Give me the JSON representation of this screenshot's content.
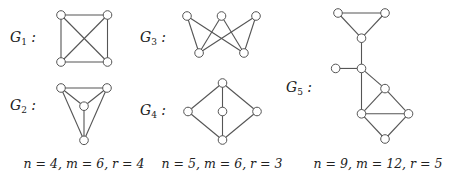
{
  "graphs": [
    {
      "id": "G1",
      "label": "G",
      "subscript": "1",
      "suffix": " :",
      "vertices": [
        [
          0,
          0
        ],
        [
          1,
          0
        ],
        [
          0,
          1
        ],
        [
          1,
          1
        ]
      ],
      "edges": [
        [
          0,
          1
        ],
        [
          0,
          2
        ],
        [
          1,
          3
        ],
        [
          2,
          3
        ],
        [
          0,
          3
        ],
        [
          1,
          2
        ]
      ]
    },
    {
      "id": "G2",
      "label": "G",
      "subscript": "2",
      "suffix": " :",
      "vertices": [
        [
          0,
          0
        ],
        [
          2,
          0
        ],
        [
          1,
          0.4
        ],
        [
          1,
          1.15
        ]
      ],
      "edges": [
        [
          0,
          1
        ],
        [
          0,
          2
        ],
        [
          1,
          2
        ],
        [
          2,
          3
        ],
        [
          0,
          3
        ],
        [
          1,
          3
        ]
      ]
    },
    {
      "id": "G3",
      "label": "G",
      "subscript": "3",
      "suffix": " :",
      "vertices": [
        [
          0,
          0
        ],
        [
          1,
          0
        ],
        [
          2,
          0
        ],
        [
          0.35,
          1
        ],
        [
          1.65,
          1
        ]
      ],
      "edges": [
        [
          0,
          3
        ],
        [
          0,
          4
        ],
        [
          1,
          3
        ],
        [
          1,
          4
        ],
        [
          2,
          3
        ],
        [
          2,
          4
        ]
      ]
    },
    {
      "id": "G4",
      "label": "G",
      "subscript": "4",
      "suffix": " :",
      "vertices": [
        [
          1,
          0
        ],
        [
          0,
          1
        ],
        [
          1,
          1
        ],
        [
          2,
          1
        ],
        [
          1,
          2
        ]
      ],
      "edges": [
        [
          0,
          1
        ],
        [
          0,
          2
        ],
        [
          0,
          3
        ],
        [
          1,
          4
        ],
        [
          2,
          4
        ],
        [
          3,
          4
        ]
      ]
    },
    {
      "id": "G5",
      "label": "G",
      "subscript": "5",
      "suffix": " :",
      "vertices": [
        [
          0,
          0
        ],
        [
          2,
          0
        ],
        [
          1,
          1
        ],
        [
          -0.1,
          2.2
        ],
        [
          1,
          2.2
        ],
        [
          2,
          3
        ],
        [
          1,
          4
        ],
        [
          3,
          4
        ],
        [
          2,
          5
        ]
      ],
      "edges": [
        [
          0,
          1
        ],
        [
          0,
          2
        ],
        [
          1,
          2
        ],
        [
          2,
          4
        ],
        [
          3,
          4
        ],
        [
          4,
          5
        ],
        [
          4,
          6
        ],
        [
          5,
          6
        ],
        [
          5,
          7
        ],
        [
          6,
          7
        ],
        [
          6,
          8
        ],
        [
          7,
          8
        ]
      ]
    }
  ],
  "captions": [
    {
      "text": "n = 4, m = 6, r = 4"
    },
    {
      "text": "n = 5, m = 6, r = 3"
    },
    {
      "text": "n = 9, m = 12, r = 5"
    }
  ]
}
